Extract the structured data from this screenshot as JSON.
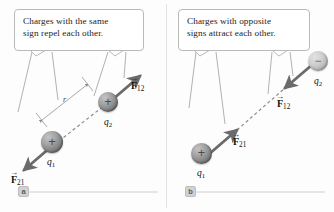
{
  "figure": {
    "panels": [
      {
        "id": "a",
        "marker_label": "a",
        "callout_text_line1": "Charges with the same",
        "callout_text_line2": "sign repel each other.",
        "interaction": "repulsion",
        "charges": [
          {
            "name": "q1",
            "label": "q",
            "subscript": "1",
            "sign": "+",
            "polarity": "positive"
          },
          {
            "name": "q2",
            "label": "q",
            "subscript": "2",
            "sign": "+",
            "polarity": "positive"
          }
        ],
        "forces": [
          {
            "name": "F12",
            "symbol": "F",
            "subscript": "12",
            "direction": "up-right",
            "accent": "vector-arrow"
          },
          {
            "name": "F21",
            "symbol": "F",
            "subscript": "21",
            "direction": "down-left",
            "accent": "vector-arrow"
          }
        ],
        "distance_label": "r"
      },
      {
        "id": "b",
        "marker_label": "b",
        "callout_text_line1": "Charges with opposite",
        "callout_text_line2": "signs attract each other.",
        "interaction": "attraction",
        "charges": [
          {
            "name": "q1",
            "label": "q",
            "subscript": "1",
            "sign": "+",
            "polarity": "positive"
          },
          {
            "name": "q2",
            "label": "q",
            "subscript": "2",
            "sign": "−",
            "polarity": "negative"
          }
        ],
        "forces": [
          {
            "name": "F12",
            "symbol": "F",
            "subscript": "12",
            "direction": "down-left",
            "accent": "vector-arrow"
          },
          {
            "name": "F21",
            "symbol": "F",
            "subscript": "21",
            "direction": "up-right",
            "accent": "vector-arrow"
          }
        ],
        "distance_label": ""
      }
    ],
    "colors": {
      "background": "#fdfdfd",
      "callout_border": "#b9b9b9",
      "leader_line": "#a8a8a8",
      "force_arrow": "#6b6b6b",
      "dashed_axis": "#8a8a8a",
      "dimension_line": "#9a9a9a",
      "marker_badge": "#d2d2d2",
      "text": "#1b1b1b"
    }
  }
}
